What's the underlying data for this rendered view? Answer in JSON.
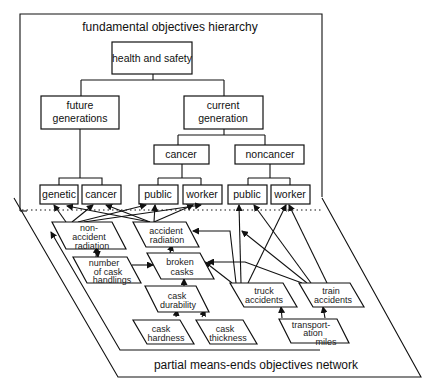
{
  "fundamental": {
    "title": "fundamental objectives hierarchy",
    "root": "health and safety",
    "future": [
      "future",
      "generations"
    ],
    "current": [
      "current",
      "generation"
    ],
    "cancer": "cancer",
    "noncancer": "noncancer",
    "leaves": [
      "genetic",
      "cancer",
      "public",
      "worker",
      "public",
      "worker"
    ]
  },
  "network": {
    "title": "partial means-ends objectives network",
    "nodes": {
      "non_accident_radiation": [
        "non-",
        "accident",
        "radiation"
      ],
      "accident_radiation": [
        "accident",
        "radiation"
      ],
      "number_of_cask_handlings": [
        "number",
        "of cask",
        "handlings"
      ],
      "broken_casks": [
        "broken",
        "casks"
      ],
      "cask_durability": [
        "cask",
        "durability"
      ],
      "truck_accidents": [
        "truck",
        "accidents"
      ],
      "train_accidents": [
        "train",
        "accidents"
      ],
      "cask_hardness": [
        "cask",
        "hardness"
      ],
      "cask_thickness": [
        "cask",
        "thickness"
      ],
      "transportation_miles": [
        "transport-",
        "ation",
        "miles"
      ]
    }
  }
}
